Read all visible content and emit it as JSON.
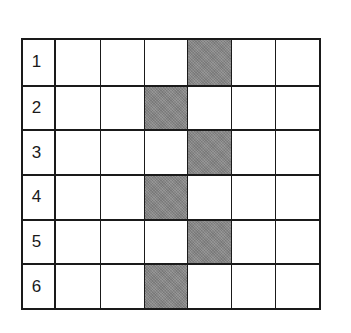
{
  "grid": {
    "rows": 6,
    "columns": 6,
    "row_labels": [
      "1",
      "2",
      "3",
      "4",
      "5",
      "6"
    ],
    "shaded_color": "#8a8a8a",
    "border_color": "#1a1a1a",
    "shaded_cells": [
      {
        "row": 1,
        "col": 4
      },
      {
        "row": 2,
        "col": 3
      },
      {
        "row": 3,
        "col": 4
      },
      {
        "row": 4,
        "col": 3
      },
      {
        "row": 5,
        "col": 4
      },
      {
        "row": 6,
        "col": 3
      }
    ],
    "cells": [
      [
        0,
        0,
        0,
        1,
        0,
        0
      ],
      [
        0,
        0,
        1,
        0,
        0,
        0
      ],
      [
        0,
        0,
        0,
        1,
        0,
        0
      ],
      [
        0,
        0,
        1,
        0,
        0,
        0
      ],
      [
        0,
        0,
        0,
        1,
        0,
        0
      ],
      [
        0,
        0,
        1,
        0,
        0,
        0
      ]
    ]
  }
}
